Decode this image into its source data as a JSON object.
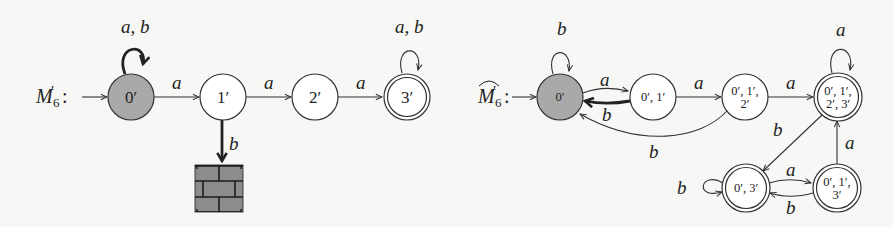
{
  "colors": {
    "background": "#f7f7f5",
    "start_state_fill": "#a9a9a9",
    "state_fill": "#ffffff",
    "stroke": "#333333",
    "brick_fill": "#8c8c8c",
    "brick_mortar": "#1a1a1a"
  },
  "left_automaton": {
    "name": "M'6",
    "title_main": "M",
    "title_prime": "′",
    "title_sub": "6",
    "title_colon": ":",
    "states": [
      {
        "id": "0'",
        "label": "0′",
        "initial": true,
        "accepting": false,
        "shaded": true
      },
      {
        "id": "1'",
        "label": "1′",
        "initial": false,
        "accepting": false
      },
      {
        "id": "2'",
        "label": "2′",
        "initial": false,
        "accepting": false
      },
      {
        "id": "3'",
        "label": "3′",
        "initial": false,
        "accepting": true
      }
    ],
    "dead_state": {
      "label": "brick-wall",
      "icon": "brick-wall-icon"
    },
    "transitions": [
      {
        "from": "0'",
        "to": "0'",
        "label": "a, b",
        "bold": true
      },
      {
        "from": "0'",
        "to": "1'",
        "label": "a"
      },
      {
        "from": "1'",
        "to": "2'",
        "label": "a"
      },
      {
        "from": "2'",
        "to": "3'",
        "label": "a"
      },
      {
        "from": "3'",
        "to": "3'",
        "label": "a, b"
      },
      {
        "from": "1'",
        "to": "dead",
        "label": "b",
        "bold": true
      }
    ]
  },
  "right_automaton": {
    "name": "hat M'6",
    "title_main": "M",
    "title_prime": "′",
    "title_sub": "6",
    "title_colon": ":",
    "states": [
      {
        "id": "0'",
        "line1": "0′",
        "line2": "",
        "initial": true,
        "accepting": false,
        "shaded": true
      },
      {
        "id": "0',1'",
        "line1": "0′, 1′",
        "line2": "",
        "initial": false,
        "accepting": false
      },
      {
        "id": "0',1',2'",
        "line1": "0′, 1′,",
        "line2": "2′",
        "initial": false,
        "accepting": false
      },
      {
        "id": "0',1',2',3'",
        "line1": "0′, 1′,",
        "line2": "2′, 3′",
        "initial": false,
        "accepting": true
      },
      {
        "id": "0',3'",
        "line1": "0′, 3′",
        "line2": "",
        "initial": false,
        "accepting": true
      },
      {
        "id": "0',1',3'",
        "line1": "0′, 1′,",
        "line2": "3′",
        "initial": false,
        "accepting": true
      }
    ],
    "transitions": [
      {
        "from": "0'",
        "to": "0'",
        "label": "b"
      },
      {
        "from": "0'",
        "to": "0',1'",
        "label": "a"
      },
      {
        "from": "0',1'",
        "to": "0'",
        "label": "b",
        "bold": true
      },
      {
        "from": "0',1'",
        "to": "0',1',2'",
        "label": "a"
      },
      {
        "from": "0',1',2'",
        "to": "0'",
        "label": "b"
      },
      {
        "from": "0',1',2'",
        "to": "0',1',2',3'",
        "label": "a"
      },
      {
        "from": "0',1',2',3'",
        "to": "0',1',2',3'",
        "label": "a"
      },
      {
        "from": "0',1',2',3'",
        "to": "0',3'",
        "label": "b"
      },
      {
        "from": "0',3'",
        "to": "0',3'",
        "label": "b"
      },
      {
        "from": "0',3'",
        "to": "0',1',3'",
        "label": "a"
      },
      {
        "from": "0',1',3'",
        "to": "0',3'",
        "label": "b"
      },
      {
        "from": "0',1',3'",
        "to": "0',1',2',3'",
        "label": "a"
      }
    ]
  }
}
